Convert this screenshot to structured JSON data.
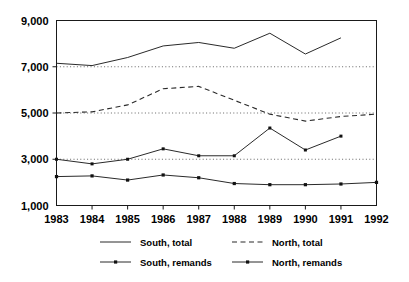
{
  "chart_data": {
    "type": "line",
    "title": "",
    "subtitle": "",
    "xlabel": "",
    "ylabel": "",
    "x": [
      1983,
      1984,
      1985,
      1986,
      1987,
      1988,
      1989,
      1990,
      1991,
      1992
    ],
    "xtick_labels": [
      "1983",
      "1984",
      "1985",
      "1986",
      "1987",
      "1988",
      "1989",
      "1990",
      "1991",
      "1992"
    ],
    "ytick_labels": [
      "9,000",
      "7,000",
      "5,000",
      "3,000",
      "1,000"
    ],
    "ytick_values": [
      9000,
      7000,
      5000,
      3000,
      1000
    ],
    "xlim": [
      1983,
      1992
    ],
    "ylim": [
      1000,
      9000
    ],
    "grid": "horizontal dotted at 3,000 / 5,000 / 7,000",
    "legend_position": "bottom",
    "series": [
      {
        "name": "South, total",
        "style": "solid",
        "marker": "none",
        "x": [
          1983,
          1984,
          1985,
          1986,
          1987,
          1988,
          1989,
          1990,
          1991
        ],
        "values": [
          7150,
          7050,
          7400,
          7900,
          8050,
          7800,
          8450,
          7550,
          8250
        ]
      },
      {
        "name": "North, total",
        "style": "dashed",
        "marker": "none",
        "x": [
          1983,
          1984,
          1985,
          1986,
          1987,
          1988,
          1989,
          1990,
          1991,
          1992
        ],
        "values": [
          5000,
          5050,
          5350,
          6050,
          6150,
          5550,
          4950,
          4650,
          4850,
          4950
        ]
      },
      {
        "name": "South, remands",
        "style": "solid",
        "marker": "dot",
        "x": [
          1983,
          1984,
          1985,
          1986,
          1987,
          1988,
          1989,
          1990,
          1991
        ],
        "values": [
          3000,
          2800,
          3000,
          3450,
          3150,
          3150,
          4350,
          3400,
          4000
        ]
      },
      {
        "name": "North, remands",
        "style": "solid",
        "marker": "square",
        "x": [
          1983,
          1984,
          1985,
          1986,
          1987,
          1988,
          1989,
          1990,
          1991,
          1992
        ],
        "values": [
          2250,
          2280,
          2100,
          2320,
          2200,
          1950,
          1900,
          1900,
          1930,
          2000
        ]
      }
    ],
    "legend": [
      {
        "label": "South, total",
        "style": "solid",
        "marker": "none"
      },
      {
        "label": "North, total",
        "style": "dashed",
        "marker": "none"
      },
      {
        "label": "South, remands",
        "style": "solid",
        "marker": "dot"
      },
      {
        "label": "North, remands",
        "style": "solid",
        "marker": "square"
      }
    ]
  }
}
